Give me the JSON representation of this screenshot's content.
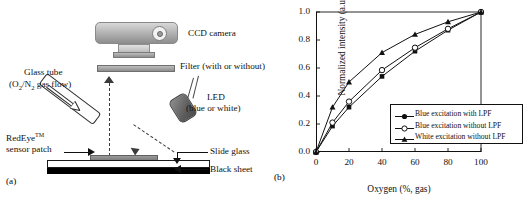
{
  "panel_a": {
    "tag": "(a)",
    "labels": {
      "ccd_camera": "CCD camera",
      "filter": "Filter (with or without)",
      "led_line1": "LED",
      "led_line2": "(blue or white)",
      "glass_tube_line1": "Glass tube",
      "glass_tube_line2_pre": "(O",
      "glass_tube_line2_sub1": "2",
      "glass_tube_line2_mid": "/N",
      "glass_tube_line2_sub2": "2",
      "glass_tube_line2_post": " gas flow)",
      "redeye_line1_pre": "RedEye",
      "redeye_line1_sup": "TM",
      "redeye_line2": "sensor patch",
      "slide_glass": "Slide glass",
      "black_sheet": "Black sheet"
    },
    "icons": {
      "camera": "ccd-camera-icon",
      "filter": "optical-filter-icon",
      "led": "led-source-icon",
      "tube": "glass-tube-icon",
      "emission_arrow": "emission-path-arrow",
      "excitation_arrow": "excitation-path-arrow"
    }
  },
  "panel_b": {
    "tag": "(b)"
  },
  "chart_data": {
    "type": "line",
    "title": "",
    "xlabel": "Oxygen (%, gas)",
    "ylabel": "Normalized intensity (a.u.)",
    "x": [
      0,
      10,
      20,
      40,
      60,
      80,
      100
    ],
    "xlim": [
      0,
      100
    ],
    "ylim": [
      0,
      1.0
    ],
    "xticks": [
      0,
      20,
      40,
      60,
      80,
      100
    ],
    "xtick_labels": [
      "0",
      "20",
      "40",
      "60",
      "80",
      "100"
    ],
    "yticks": [
      0.0,
      0.2,
      0.4,
      0.6,
      0.8,
      1.0
    ],
    "ytick_labels": [
      "0.0",
      "0.2",
      "0.4",
      "0.6",
      "0.8",
      "1.0"
    ],
    "grid": false,
    "legend_position": "lower-right-inside",
    "series": [
      {
        "name": "Blue excitation with LPF",
        "marker": "filled-circle",
        "values": [
          0.0,
          0.185,
          0.32,
          0.54,
          0.72,
          0.87,
          1.0
        ]
      },
      {
        "name": "Blue excitation without LPF",
        "marker": "open-circle",
        "values": [
          0.0,
          0.21,
          0.36,
          0.585,
          0.745,
          0.88,
          1.0
        ]
      },
      {
        "name": "White excitation without LPF",
        "marker": "filled-triangle",
        "values": [
          0.0,
          0.32,
          0.5,
          0.71,
          0.84,
          0.93,
          1.0
        ]
      }
    ]
  },
  "colors": {
    "line": "#111111",
    "background": "#ffffff",
    "camera_body": "#b4b4b4",
    "black_sheet": "#000000"
  }
}
